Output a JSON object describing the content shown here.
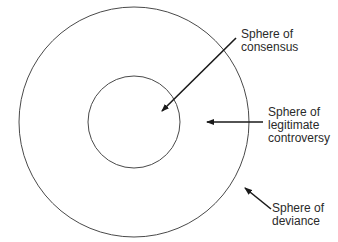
{
  "diagram": {
    "spheres": [
      {
        "id": "consensus",
        "label_line1": "Sphere of",
        "label_line2": "consensus"
      },
      {
        "id": "legitimate-controversy",
        "label_line1": "Sphere of",
        "label_line2": "legitimate",
        "label_line3": "controversy"
      },
      {
        "id": "deviance",
        "label_line1": "Sphere of",
        "label_line2": "deviance"
      }
    ],
    "colors": {
      "stroke": "#4a4a4a",
      "arrow": "#1a1a1a",
      "text": "#2a2a2a"
    }
  }
}
